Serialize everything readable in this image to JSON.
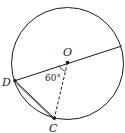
{
  "diagram": {
    "type": "circle-geometry",
    "points": {
      "O": {
        "label": "O",
        "x": 67.5,
        "y": 62.5,
        "role": "center"
      },
      "D": {
        "label": "D",
        "x": 15,
        "y": 80.7
      },
      "C": {
        "label": "C",
        "x": 54.3,
        "y": 118.3
      },
      "E": {
        "label": "",
        "x": 121.7,
        "y": 46
      }
    },
    "circle": {
      "cx": 67.5,
      "cy": 63.5,
      "r": 56
    },
    "segments": [
      {
        "from": "D",
        "to": "E",
        "style": "solid",
        "note": "diameter through O"
      },
      {
        "from": "O",
        "to": "C",
        "style": "dashed"
      },
      {
        "from": "D",
        "to": "C",
        "style": "solid",
        "note": "double line chord"
      }
    ],
    "angle": {
      "vertex": "O",
      "between": [
        "D",
        "C"
      ],
      "label": "60°"
    },
    "colors": {
      "stroke": "#1a1a1a",
      "background": "#ffffff"
    }
  }
}
